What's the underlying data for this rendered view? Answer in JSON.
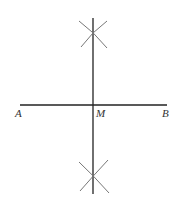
{
  "diagram": {
    "colors": {
      "line": "#222222",
      "arc": "#777777",
      "label": "#333333",
      "background": "#ffffff"
    },
    "points": {
      "A": {
        "label": "A",
        "x": 20,
        "y": 105
      },
      "B": {
        "label": "B",
        "x": 167,
        "y": 105
      },
      "M": {
        "label": "M",
        "x": 93,
        "y": 105
      }
    },
    "labels": {
      "A": "A",
      "M": "M",
      "B": "B"
    }
  }
}
